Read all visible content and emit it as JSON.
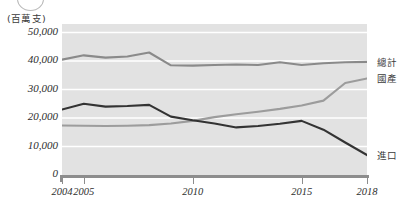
{
  "chart_data": {
    "type": "line",
    "title": "",
    "unit_caption": "(百萬支)",
    "xlabel": "",
    "ylabel": "",
    "x": [
      2004,
      2005,
      2006,
      2007,
      2008,
      2009,
      2010,
      2011,
      2012,
      2013,
      2014,
      2015,
      2016,
      2017,
      2018
    ],
    "x_tick_labels": [
      "2004",
      "2005",
      "2010",
      "2015",
      "2018"
    ],
    "x_tick_values": [
      2004,
      2005,
      2010,
      2015,
      2018
    ],
    "xlim": [
      2004,
      2018
    ],
    "y_tick_labels": [
      "0",
      "10,000",
      "20,000",
      "30,000",
      "40,000",
      "50,000"
    ],
    "y_tick_values": [
      0,
      10000,
      20000,
      30000,
      40000,
      50000
    ],
    "ylim": [
      0,
      53000
    ],
    "grid": true,
    "legend_position": "right",
    "series": [
      {
        "name": "總計",
        "color": "#8a8a8a",
        "values": [
          40500,
          42000,
          41200,
          41600,
          43000,
          38500,
          38400,
          38600,
          38800,
          38600,
          39600,
          38600,
          39200,
          39600,
          39700
        ]
      },
      {
        "name": "國產",
        "color": "#9c9c9c",
        "values": [
          17400,
          17300,
          17200,
          17300,
          17500,
          18100,
          19000,
          20300,
          21300,
          22200,
          23200,
          24400,
          26100,
          32300,
          33900
        ]
      },
      {
        "name": "進口",
        "color": "#333333",
        "values": [
          23000,
          25000,
          24000,
          24200,
          24600,
          20500,
          19200,
          18100,
          16700,
          17200,
          18000,
          19000,
          15900,
          11400,
          7000
        ]
      }
    ]
  }
}
